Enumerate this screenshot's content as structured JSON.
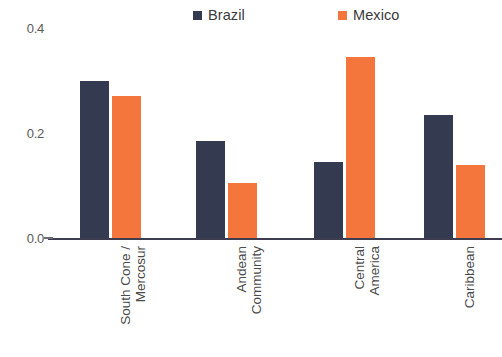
{
  "chart_data": {
    "type": "bar",
    "title": "",
    "subtitle": "",
    "xlabel": "",
    "ylabel": "",
    "categories": [
      "South Cone /\nMercosur",
      "Andean\nCommunity",
      "Central\nAmerica",
      "Caribbean"
    ],
    "series": [
      {
        "name": "Brazil",
        "color": "#343a4f",
        "values": [
          0.3,
          0.185,
          0.145,
          0.235
        ]
      },
      {
        "name": "Mexico",
        "color": "#f4763c",
        "values": [
          0.27,
          0.105,
          0.345,
          0.14
        ]
      }
    ],
    "ylim": [
      0.0,
      0.4
    ],
    "yticks": [
      "0.0",
      "0.2",
      "0.4"
    ],
    "ytick_values": [
      0.0,
      0.2,
      0.4
    ],
    "grid": false,
    "legend_position": "top-center",
    "orientation": "vertical",
    "grouping": "grouped"
  },
  "legend": {
    "entries": [
      {
        "label": "Brazil",
        "marker": "square-marker",
        "color": "#343a4f"
      },
      {
        "label": "Mexico",
        "marker": "square-marker",
        "color": "#f4763c"
      }
    ]
  },
  "axes": {
    "y_tick_labels": [
      "0.4",
      "0.2",
      "0.0"
    ],
    "x_tick_labels": [
      "South Cone /\nMercosur",
      "Andean\nCommunity",
      "Central\nAmerica",
      "Caribbean"
    ]
  }
}
